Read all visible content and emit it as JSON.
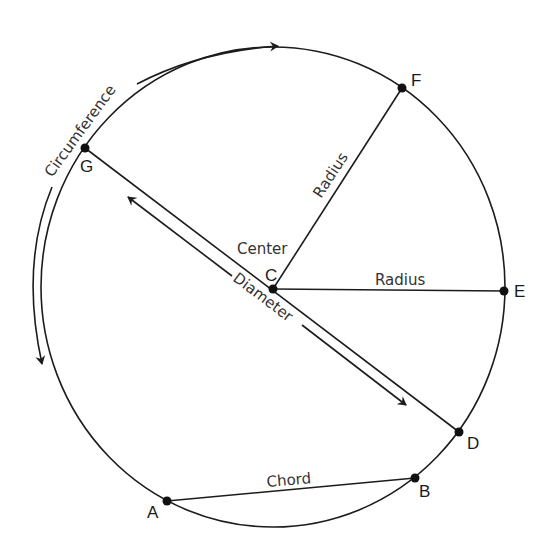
{
  "diagram": {
    "colors": {
      "line": "#1c1c1c",
      "text": "#333333",
      "background": "#ffffff"
    },
    "points": {
      "A": {
        "label": "A",
        "x": 167,
        "y": 501
      },
      "B": {
        "label": "B",
        "x": 415,
        "y": 478
      },
      "C": {
        "label": "C",
        "x": 273,
        "y": 289
      },
      "D": {
        "label": "D",
        "x": 459,
        "y": 432
      },
      "E": {
        "label": "E",
        "x": 504,
        "y": 291
      },
      "F": {
        "label": "F",
        "x": 402,
        "y": 88
      },
      "G": {
        "label": "G",
        "x": 85,
        "y": 148
      }
    },
    "labels": {
      "circumference": "Circumference",
      "center": "Center",
      "diameter": "Diameter",
      "radius_cf": "Radius",
      "radius_ce": "Radius",
      "chord": "Chord"
    }
  }
}
